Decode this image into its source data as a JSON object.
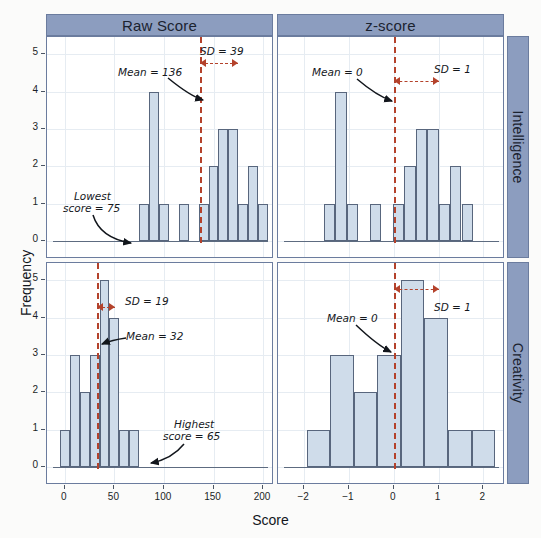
{
  "figure": {
    "axis_titles": {
      "x": "Score",
      "y": "Frequency"
    },
    "column_strips": [
      "Raw Score",
      "z-score"
    ],
    "row_strips": [
      "Intelligence",
      "Creativity"
    ],
    "colors": {
      "strip_fill": "#8c9dbf",
      "bar_fill": "#cfdcea",
      "bar_border": "#58667d",
      "mean_line": "#b4422b",
      "grid": "#e6ecf2",
      "panel_bg": "#ffffff"
    }
  },
  "chart_data": [
    {
      "type": "bar",
      "title": "Raw Score",
      "row": "Intelligence",
      "xlabel": "Score",
      "ylabel": "Frequency",
      "xlim": [
        -12,
        205
      ],
      "ylim": [
        0,
        5.3
      ],
      "xticks": [
        0,
        50,
        100,
        150,
        200
      ],
      "yticks": [
        0,
        1,
        2,
        3,
        4,
        5
      ],
      "grid": true,
      "bin_width": 10,
      "bin_starts": [
        75,
        85,
        95,
        105,
        115,
        125,
        135,
        145,
        155,
        165,
        175,
        185,
        195
      ],
      "values": [
        1,
        4,
        1,
        0,
        1,
        0,
        1,
        2,
        3,
        3,
        1,
        2,
        1
      ],
      "mean": 136,
      "sd": 39,
      "annotations": [
        {
          "text": "Mean = 136",
          "kind": "mean-label"
        },
        {
          "text": "SD = 39",
          "kind": "sd-label"
        },
        {
          "text": "Lowest\nscore = 75",
          "kind": "extreme-label"
        }
      ]
    },
    {
      "type": "bar",
      "title": "z-score",
      "row": "Intelligence",
      "xlabel": "Score",
      "ylabel": "Frequency",
      "xlim": [
        -2.45,
        2.35
      ],
      "ylim": [
        0,
        5.3
      ],
      "xticks": [
        -2,
        -1,
        0,
        1,
        2
      ],
      "yticks": [
        0,
        1,
        2,
        3,
        4,
        5
      ],
      "grid": true,
      "bin_width": 0.2564,
      "bin_starts": [
        -1.564,
        -1.308,
        -1.051,
        -0.795,
        -0.538,
        -0.282,
        -0.026,
        0.231,
        0.487,
        0.744,
        1.0,
        1.256,
        1.513
      ],
      "values": [
        1,
        4,
        1,
        0,
        1,
        0,
        1,
        2,
        3,
        3,
        1,
        2,
        1
      ],
      "mean": 0,
      "sd": 1,
      "annotations": [
        {
          "text": "Mean = 0",
          "kind": "mean-label"
        },
        {
          "text": "SD = 1",
          "kind": "sd-label"
        }
      ]
    },
    {
      "type": "bar",
      "title": "Raw Score",
      "row": "Creativity",
      "xlabel": "Score",
      "ylabel": "Frequency",
      "xlim": [
        -12,
        205
      ],
      "ylim": [
        0,
        5.3
      ],
      "xticks": [
        0,
        50,
        100,
        150,
        200
      ],
      "yticks": [
        0,
        1,
        2,
        3,
        4,
        5
      ],
      "grid": true,
      "bin_width": 10,
      "bin_starts": [
        -5,
        5,
        15,
        25,
        35,
        45,
        55,
        65
      ],
      "values": [
        1,
        3,
        2,
        3,
        5,
        4,
        1,
        1
      ],
      "mean": 32,
      "sd": 19,
      "annotations": [
        {
          "text": "SD = 19",
          "kind": "sd-label"
        },
        {
          "text": "Mean = 32",
          "kind": "mean-label"
        },
        {
          "text": "Highest\nscore = 65",
          "kind": "extreme-label"
        }
      ]
    },
    {
      "type": "bar",
      "title": "z-score",
      "row": "Creativity",
      "xlabel": "Score",
      "ylabel": "Frequency",
      "xlim": [
        -2.45,
        2.35
      ],
      "ylim": [
        0,
        5.3
      ],
      "xticks": [
        -2,
        -1,
        0,
        1,
        2
      ],
      "yticks": [
        0,
        1,
        2,
        3,
        4,
        5
      ],
      "grid": true,
      "bin_width": 0.5263,
      "bin_starts": [
        -1.947,
        -1.421,
        -0.895,
        -0.368,
        0.158,
        0.684,
        1.211,
        1.737
      ],
      "values": [
        1,
        3,
        2,
        3,
        5,
        4,
        1,
        1
      ],
      "mean": 0,
      "sd": 1,
      "annotations": [
        {
          "text": "Mean = 0",
          "kind": "mean-label"
        },
        {
          "text": "SD = 1",
          "kind": "sd-label"
        }
      ]
    }
  ],
  "annotations": {
    "p1_mean": "Mean = 136",
    "p1_sd": "SD = 39",
    "p1_lowest_l1": "Lowest",
    "p1_lowest_l2": "score = 75",
    "p2_mean": "Mean = 0",
    "p2_sd": "SD = 1",
    "p3_sd": "SD = 19",
    "p3_mean": "Mean = 32",
    "p3_highest_l1": "Highest",
    "p3_highest_l2": "score = 65",
    "p4_mean": "Mean = 0",
    "p4_sd": "SD = 1"
  },
  "yticklabels": [
    "0",
    "1",
    "2",
    "3",
    "4",
    "5"
  ],
  "xticklabels_raw": [
    "0",
    "50",
    "100",
    "150",
    "200"
  ],
  "xticklabels_z": [
    "−2",
    "−1",
    "0",
    "1",
    "2"
  ]
}
